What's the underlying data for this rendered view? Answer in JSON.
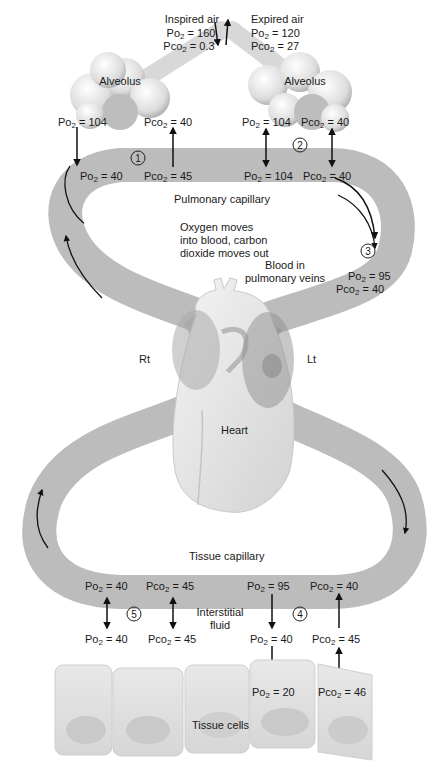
{
  "colors": {
    "vessel": "#b9b9b9",
    "vessel_dark": "#9d9d9d",
    "heart": "#e6e6e6",
    "cell": "#dedede",
    "alveolus": "#e9e9e9",
    "text": "#1a1a1a",
    "arrow": "#111111"
  },
  "air": {
    "inspired": {
      "label": "Inspired air",
      "po2": "160",
      "pco2": "0.3"
    },
    "expired": {
      "label": "Expired air",
      "po2": "120",
      "pco2": "27"
    }
  },
  "alveoli": {
    "left": {
      "label": "Alveolus",
      "po2": "104",
      "pco2": "40"
    },
    "right": {
      "label": "Alveolus",
      "po2": "104",
      "pco2": "40"
    }
  },
  "pulmonary": {
    "label": "Pulmonary capillary",
    "arterial_end": {
      "step": "1",
      "po2": "40",
      "pco2": "45"
    },
    "venous_end": {
      "step": "2",
      "po2": "104",
      "pco2": "40"
    },
    "note": [
      "Oxygen moves",
      "into blood, carbon",
      "dioxide moves out"
    ]
  },
  "pulmonary_veins": {
    "step": "3",
    "label": [
      "Blood in",
      "pulmonary veins"
    ],
    "po2": "95",
    "pco2": "40"
  },
  "heart": {
    "label": "Heart",
    "right_side": "Rt",
    "left_side": "Lt"
  },
  "tissue": {
    "label": "Tissue capillary",
    "interstitial_label": [
      "Interstitial",
      "fluid"
    ],
    "venous_end": {
      "step": "5",
      "capillary": {
        "po2": "40",
        "pco2": "45"
      },
      "interstitial": {
        "po2": "40",
        "pco2": "45"
      }
    },
    "arterial_end": {
      "step": "4",
      "capillary": {
        "po2": "95",
        "pco2": "40"
      },
      "interstitial": {
        "po2": "40",
        "pco2": "45"
      },
      "cells": {
        "po2": "20",
        "pco2": "46"
      }
    },
    "cells_label": "Tissue cells"
  },
  "gas": {
    "po2_prefix": "Po",
    "pco2_prefix": "Pco",
    "sub": "2",
    "eq": " = "
  }
}
